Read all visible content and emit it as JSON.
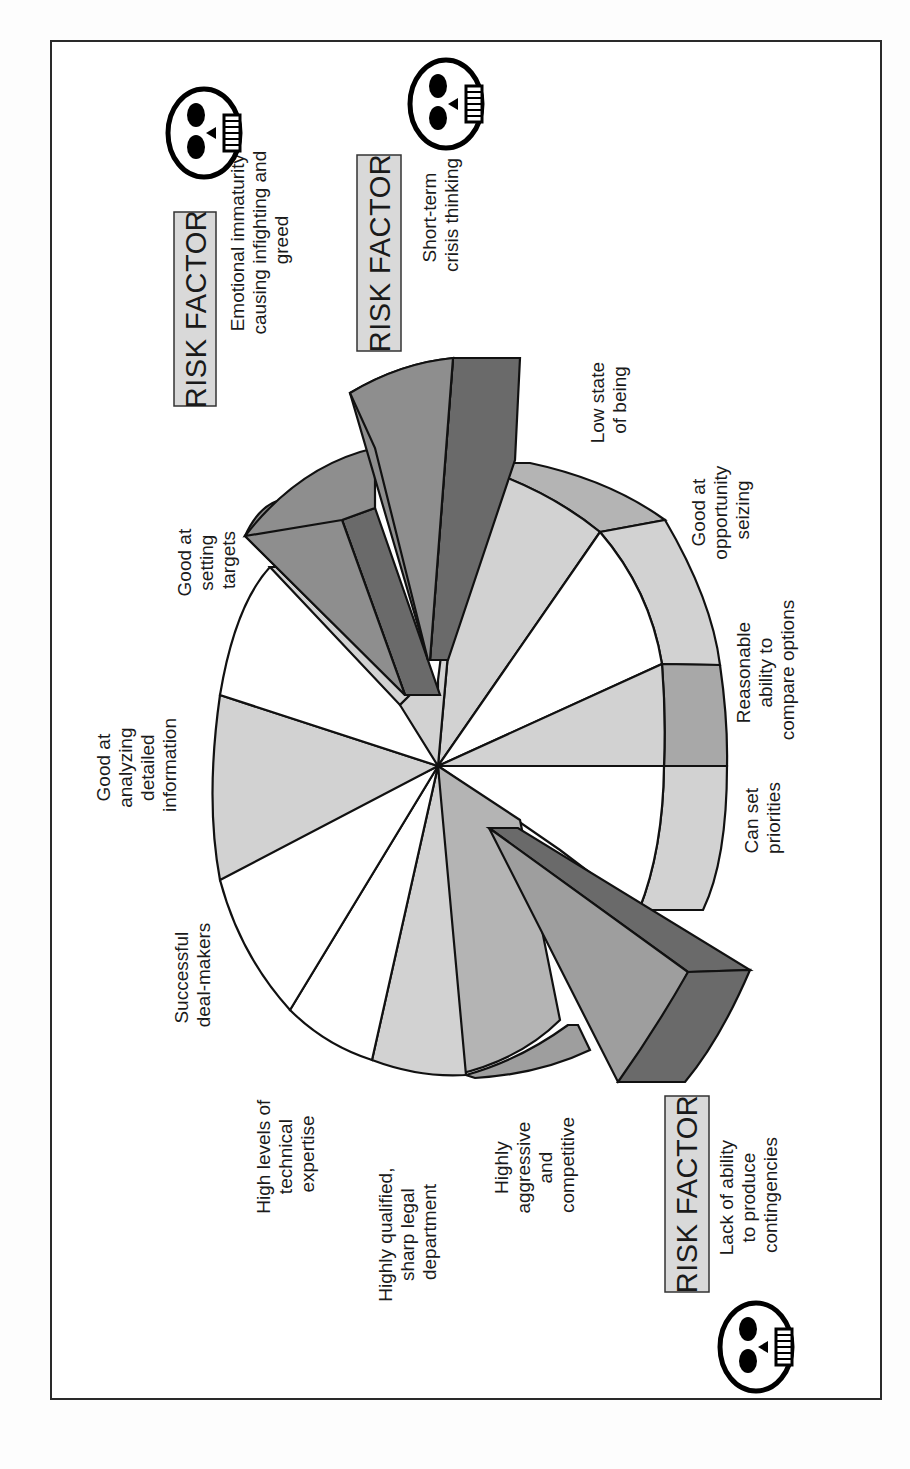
{
  "figure": {
    "orientation": "rotated -90deg (landscape figure on portrait page)",
    "type": "exploded 3D pie diagram"
  },
  "colors": {
    "white": "#ffffff",
    "light_gray": "#d2d2d2",
    "mid_gray": "#b4b4b4",
    "dark_gray": "#8e8e8e",
    "darker_gray": "#6a6a6a",
    "risk_box": "#d9d9d9",
    "outline": "#111111"
  },
  "segments": [
    {
      "label": "Good at setting targets",
      "fill": "white"
    },
    {
      "label": "Good at analyzing detailed information",
      "fill": "light_gray"
    },
    {
      "label": "Successful deal-makers",
      "fill": "white"
    },
    {
      "label": "High levels of technical expertise",
      "fill": "white"
    },
    {
      "label": "Highly qualified, sharp legal department",
      "fill": "light_gray"
    },
    {
      "label": "Highly aggressive and competitive",
      "fill": "mid_gray"
    },
    {
      "label": "Lack of ability to produce contingencies",
      "fill": "dark_gray",
      "exploded": true,
      "risk": true
    },
    {
      "label": "Can set priorities",
      "fill": "white"
    },
    {
      "label": "Reasonable ability to compare options",
      "fill": "light_gray"
    },
    {
      "label": "Good at opportunity seizing",
      "fill": "white"
    },
    {
      "label": "Low state of being",
      "fill": "light_gray"
    },
    {
      "label": "Short-term crisis thinking",
      "fill": "dark_gray",
      "exploded": true,
      "risk": true
    },
    {
      "label": "Emotional immaturity causing infighting and greed",
      "fill": "dark_gray",
      "exploded": true,
      "risk": true
    }
  ],
  "labels": {
    "setting_targets": [
      "Good at",
      "setting",
      "targets"
    ],
    "analyzing": [
      "Good at",
      "analyzing",
      "detailed",
      "information"
    ],
    "deal_makers": [
      "Successful",
      "deal-makers"
    ],
    "technical": [
      "High levels of",
      "technical",
      "expertise"
    ],
    "legal": [
      "Highly qualified,",
      "sharp legal",
      "department"
    ],
    "aggressive": [
      "Highly",
      "aggressive",
      "and",
      "competitive"
    ],
    "priorities": [
      "Can set",
      "priorities"
    ],
    "compare": [
      "Reasonable",
      "ability to",
      "compare options"
    ],
    "opportunity": [
      "Good at",
      "opportunity",
      "seizing"
    ],
    "low_state": [
      "Low state",
      "of being"
    ]
  },
  "risk_factors": [
    {
      "badge": "RISK FACTOR",
      "text": [
        "Emotional immaturity",
        "causing infighting and",
        "greed"
      ],
      "icon": "skull-icon"
    },
    {
      "badge": "RISK FACTOR",
      "text": [
        "Short-term",
        "crisis thinking"
      ],
      "icon": "skull-icon"
    },
    {
      "badge": "RISK FACTOR",
      "text": [
        "Lack of ability",
        "to produce",
        "contingencies"
      ],
      "icon": "skull-icon"
    }
  ]
}
